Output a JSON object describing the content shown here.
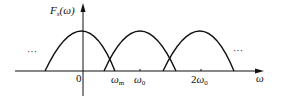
{
  "diagram": {
    "title": "Fs(ω)",
    "y_axis_label": "F_s(ω)",
    "x_axis_label": "ω",
    "origin_label": "0",
    "tick_labels": {
      "omega_m": "ω_m",
      "omega_0": "ω_0",
      "two_omega_0": "2ω_0"
    },
    "continuation_left": "···",
    "continuation_right": "···",
    "lobes": [
      {
        "center": "0",
        "description": "spectrum copy centered at 0"
      },
      {
        "center": "ω_0",
        "description": "spectrum copy centered at ω_0"
      },
      {
        "center": "2ω_0",
        "description": "spectrum copy centered at 2ω_0"
      }
    ],
    "note": "Overlapping (aliased) spectra since ω_0 < 2ω_m"
  }
}
